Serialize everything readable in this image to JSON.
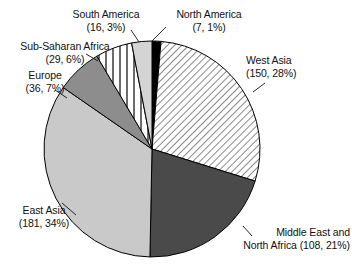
{
  "chart_data": {
    "type": "pie",
    "title": "",
    "subtitle": "",
    "xlabel": "",
    "ylabel": "",
    "legend_position": "none",
    "grid": false,
    "total": 527,
    "value_unit": "count",
    "label_format": "(count, percent%)",
    "categories": [
      "North America",
      "West Asia",
      "Middle East and North Africa",
      "East Asia",
      "Europe",
      "Sub-Saharan Africa",
      "South America"
    ],
    "values": [
      7,
      150,
      108,
      181,
      36,
      29,
      16
    ],
    "percentages": [
      1,
      28,
      21,
      34,
      7,
      6,
      3
    ],
    "slices": [
      {
        "name": "north-america",
        "label": "North America",
        "value": 7,
        "percent": 1,
        "label_line1": "North America",
        "label_line2": "(7, 1%)",
        "fill_style": "solid",
        "color": "#000000",
        "start_angle_deg": 0,
        "end_angle_deg": 4.8
      },
      {
        "name": "west-asia",
        "label": "West Asia",
        "value": 150,
        "percent": 28,
        "label_line1": "West Asia",
        "label_line2": "(150, 28%)",
        "fill_style": "diagonal-hatch",
        "color": "#ffffff",
        "start_angle_deg": 4.8,
        "end_angle_deg": 107.3
      },
      {
        "name": "middle-east-north-africa",
        "label": "Middle East and North Africa",
        "value": 108,
        "percent": 21,
        "label_line1": "Middle East and",
        "label_line2": "North Africa (108, 21%)",
        "fill_style": "solid",
        "color": "#4a4a4a",
        "start_angle_deg": 107.3,
        "end_angle_deg": 181.1
      },
      {
        "name": "east-asia",
        "label": "East Asia",
        "value": 181,
        "percent": 34,
        "label_line1": "East Asia",
        "label_line2": "(181, 34%)",
        "fill_style": "solid",
        "color": "#c9c9c9",
        "start_angle_deg": 181.1,
        "end_angle_deg": 304.7
      },
      {
        "name": "europe",
        "label": "Europe",
        "value": 36,
        "percent": 7,
        "label_line1": "Europe",
        "label_line2": "(36, 7%)",
        "fill_style": "solid",
        "color": "#8d8d8d",
        "start_angle_deg": 304.7,
        "end_angle_deg": 329.3
      },
      {
        "name": "sub-saharan-africa",
        "label": "Sub-Saharan Africa",
        "value": 29,
        "percent": 6,
        "label_line1": "Sub-Saharan Africa",
        "label_line2": "(29, 6%)",
        "fill_style": "vertical-stripes",
        "color": "#ffffff",
        "start_angle_deg": 329.3,
        "end_angle_deg": 349.1
      },
      {
        "name": "south-america",
        "label": "South America",
        "value": 16,
        "percent": 3,
        "label_line1": "South America",
        "label_line2": "(16, 3%)",
        "fill_style": "solid",
        "color": "#d4d4d4",
        "start_angle_deg": 349.1,
        "end_angle_deg": 360
      }
    ],
    "geometry": {
      "center_x": 152,
      "center_y": 149,
      "radius": 108,
      "start_at_top": true,
      "direction": "clockwise"
    },
    "colors": {
      "outline": "#000000",
      "background": "#ffffff",
      "text": "#111111"
    }
  }
}
